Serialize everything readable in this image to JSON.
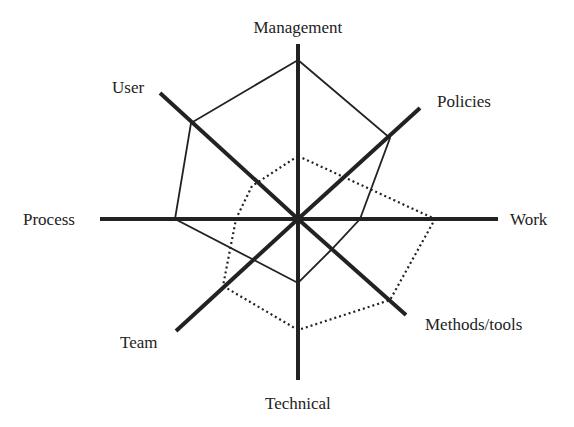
{
  "diagram": {
    "type": "radar",
    "center": [
      298,
      219
    ],
    "axes": [
      {
        "label": "Management",
        "end": [
          298,
          44
        ],
        "label_pos": [
          298,
          19
        ],
        "anchor": "center"
      },
      {
        "label": "Policies",
        "end": [
          420,
          108
        ],
        "label_pos": [
          437,
          93
        ],
        "anchor": "left"
      },
      {
        "label": "Work",
        "end": [
          498,
          219
        ],
        "label_pos": [
          510,
          211
        ],
        "anchor": "left"
      },
      {
        "label": "Methods/tools",
        "end": [
          406,
          315
        ],
        "label_pos": [
          425,
          316
        ],
        "anchor": "left"
      },
      {
        "label": "Technical",
        "end": [
          298,
          380
        ],
        "label_pos": [
          298,
          395
        ],
        "anchor": "center"
      },
      {
        "label": "Team",
        "end": [
          176,
          331
        ],
        "label_pos": [
          120,
          334
        ],
        "anchor": "left"
      },
      {
        "label": "Process",
        "end": [
          100,
          219
        ],
        "label_pos": [
          23,
          211
        ],
        "anchor": "left"
      },
      {
        "label": "User",
        "end": [
          160,
          93
        ],
        "label_pos": [
          112,
          79
        ],
        "anchor": "left"
      }
    ],
    "series": [
      {
        "name": "solid",
        "style": "solid",
        "points": [
          [
            298,
            60
          ],
          [
            390,
            138
          ],
          [
            360,
            219
          ],
          [
            332,
            249
          ],
          [
            298,
            283
          ],
          [
            254,
            260
          ],
          [
            175,
            219
          ],
          [
            191,
            123
          ]
        ]
      },
      {
        "name": "dotted",
        "style": "dotted",
        "points": [
          [
            298,
            156
          ],
          [
            435,
            219
          ],
          [
            390,
            300
          ],
          [
            298,
            330
          ],
          [
            223,
            286
          ],
          [
            236,
            219
          ],
          [
            252,
            186
          ]
        ]
      }
    ]
  },
  "chart_data": {
    "type": "radar",
    "categories": [
      "Management",
      "Policies",
      "Work",
      "Methods/tools",
      "Technical",
      "Team",
      "Process",
      "User"
    ],
    "series": [
      {
        "name": "solid line",
        "values": [
          0.91,
          0.79,
          0.31,
          0.36,
          0.39,
          0.36,
          0.62,
          0.62
        ]
      },
      {
        "name": "dotted line",
        "values": [
          0.36,
          0.5,
          0.69,
          0.67,
          0.69,
          0.55,
          0.31,
          0.35
        ]
      }
    ],
    "title": "",
    "legend": "none",
    "grid": false
  }
}
